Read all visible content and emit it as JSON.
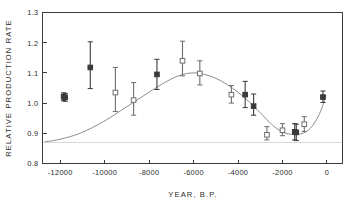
{
  "chart_data": {
    "type": "scatter",
    "title": "",
    "xlabel": "YEAR, B.P.",
    "ylabel": "RELATIVE PRODUCTION RATE",
    "xlim": [
      -12800,
      700
    ],
    "ylim": [
      0.8,
      1.3
    ],
    "xticks": [
      -12000,
      -10000,
      -8000,
      -6000,
      -4000,
      -2000,
      0
    ],
    "xticklabels": [
      "-12000",
      "-10000",
      "-8000",
      "-6000",
      "-4000",
      "-2000",
      "0"
    ],
    "yticks": [
      0.8,
      0.9,
      1.0,
      1.1,
      1.2,
      1.3
    ],
    "yticklabels": [
      "0.8",
      "0.9",
      "1.0",
      "1.1",
      "1.2",
      "1.3"
    ],
    "grid": false,
    "legend": null,
    "reference_line": {
      "y": 0.87,
      "color": "#d8d8d8"
    },
    "curve_color": "#8d8d8d",
    "marker_colors": {
      "open": "#6e6e6e",
      "filled": "#3a3a3a"
    },
    "series": [
      {
        "name": "Relative production rate",
        "points": [
          {
            "x": -11850,
            "y": 1.021,
            "yerr_low": 1.008,
            "yerr_high": 1.034,
            "marker": "filled"
          },
          {
            "x": -11780,
            "y": 1.019,
            "yerr_low": 1.006,
            "yerr_high": 1.032,
            "marker": "filled"
          },
          {
            "x": -10650,
            "y": 1.118,
            "yerr_low": 1.048,
            "yerr_high": 1.203,
            "marker": "filled"
          },
          {
            "x": -9520,
            "y": 1.035,
            "yerr_low": 0.972,
            "yerr_high": 1.118,
            "marker": "open"
          },
          {
            "x": -8700,
            "y": 1.01,
            "yerr_low": 0.96,
            "yerr_high": 1.068,
            "marker": "open"
          },
          {
            "x": -7650,
            "y": 1.095,
            "yerr_low": 1.045,
            "yerr_high": 1.145,
            "marker": "filled"
          },
          {
            "x": -6500,
            "y": 1.14,
            "yerr_low": 1.09,
            "yerr_high": 1.205,
            "marker": "open"
          },
          {
            "x": -5720,
            "y": 1.098,
            "yerr_low": 1.06,
            "yerr_high": 1.14,
            "marker": "open"
          },
          {
            "x": -4300,
            "y": 1.028,
            "yerr_low": 1.0,
            "yerr_high": 1.058,
            "marker": "open"
          },
          {
            "x": -3680,
            "y": 1.028,
            "yerr_low": 0.985,
            "yerr_high": 1.072,
            "marker": "filled"
          },
          {
            "x": -3300,
            "y": 0.99,
            "yerr_low": 0.96,
            "yerr_high": 1.03,
            "marker": "filled"
          },
          {
            "x": -2700,
            "y": 0.895,
            "yerr_low": 0.878,
            "yerr_high": 0.922,
            "marker": "open"
          },
          {
            "x": -2000,
            "y": 0.91,
            "yerr_low": 0.892,
            "yerr_high": 0.932,
            "marker": "open"
          },
          {
            "x": -1450,
            "y": 0.905,
            "yerr_low": 0.878,
            "yerr_high": 0.932,
            "marker": "filled"
          },
          {
            "x": -1380,
            "y": 0.903,
            "yerr_low": 0.876,
            "yerr_high": 0.93,
            "marker": "filled"
          },
          {
            "x": -1020,
            "y": 0.93,
            "yerr_low": 0.906,
            "yerr_high": 0.955,
            "marker": "open"
          },
          {
            "x": -180,
            "y": 1.02,
            "yerr_low": 1.002,
            "yerr_high": 1.04,
            "marker": "filled"
          }
        ]
      }
    ],
    "fitted_curve": [
      {
        "x": -12700,
        "y": 0.872
      },
      {
        "x": -12300,
        "y": 0.876
      },
      {
        "x": -11800,
        "y": 0.884
      },
      {
        "x": -11300,
        "y": 0.895
      },
      {
        "x": -10800,
        "y": 0.91
      },
      {
        "x": -10300,
        "y": 0.929
      },
      {
        "x": -9800,
        "y": 0.95
      },
      {
        "x": -9300,
        "y": 0.974
      },
      {
        "x": -8800,
        "y": 0.998
      },
      {
        "x": -8300,
        "y": 1.022
      },
      {
        "x": -7800,
        "y": 1.046
      },
      {
        "x": -7300,
        "y": 1.068
      },
      {
        "x": -6800,
        "y": 1.087
      },
      {
        "x": -6300,
        "y": 1.098
      },
      {
        "x": -5900,
        "y": 1.1
      },
      {
        "x": -5500,
        "y": 1.095
      },
      {
        "x": -5000,
        "y": 1.082
      },
      {
        "x": -4500,
        "y": 1.062
      },
      {
        "x": -4000,
        "y": 1.036
      },
      {
        "x": -3500,
        "y": 1.004
      },
      {
        "x": -3000,
        "y": 0.968
      },
      {
        "x": -2700,
        "y": 0.945
      },
      {
        "x": -2400,
        "y": 0.924
      },
      {
        "x": -2100,
        "y": 0.908
      },
      {
        "x": -1800,
        "y": 0.899
      },
      {
        "x": -1500,
        "y": 0.896
      },
      {
        "x": -1200,
        "y": 0.898
      },
      {
        "x": -900,
        "y": 0.907
      },
      {
        "x": -600,
        "y": 0.93
      },
      {
        "x": -350,
        "y": 0.962
      },
      {
        "x": -150,
        "y": 1.0
      },
      {
        "x": -40,
        "y": 1.026
      }
    ]
  },
  "figure": {
    "background_color": "#ffffff",
    "axis_color": "#3c3c3c"
  }
}
